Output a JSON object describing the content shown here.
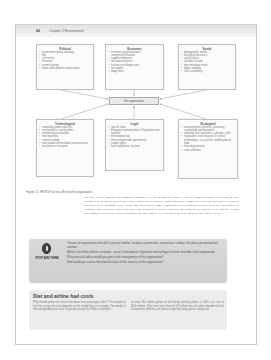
{
  "header": {
    "page_number": "44",
    "chapter_title": "Chapter 2 Environment"
  },
  "diagram": {
    "center": "the organization",
    "boxes": [
      {
        "id": "political",
        "title": "Political",
        "items": [
          "government policy, ideology",
          "war",
          "civil unrest",
          "terrorism",
          "interest groups",
          "trade union policies and activities"
        ]
      },
      {
        "id": "economic",
        "title": "Economic",
        "items": [
          "economic growth patterns",
          "competitor behaviour",
          "supplier behaviour",
          "raw material prices",
          "currency exchange rates",
          "tax regime",
          "wage rates"
        ]
      },
      {
        "id": "social",
        "title": "Social",
        "items": [
          "demographic trends",
          "lifestyle preferences",
          "social values",
          "attitudes to work",
          "discrimination trends",
          "labour mobility",
          "skills availability"
        ]
      },
      {
        "id": "technological",
        "title": "Technological",
        "items": [
          "computing power and cost",
          "new products, new facilities",
          "engineering innovations",
          "new materials",
          "internet trading",
          "new production methods and processes",
          "innovation in transport"
        ]
      },
      {
        "id": "legal",
        "title": "Legal",
        "items": [
          "specific laws",
          "European harmonization of legislation and taxation",
          "international law",
          "international trade agreements",
          "human rights",
          "local regulations, by-laws"
        ]
      },
      {
        "id": "ecological",
        "title": "Ecological",
        "items": [
          "environmental concerns, protecting countryside and biosphere",
          "reducing toxic emissions, pollution, spills",
          "regulations restricting use of certain technologies, e.g. genetic modification of food",
          "hazard prevention",
          "noise pollution"
        ]
      }
    ]
  },
  "figure_caption": "Figure 2.1: PESTLE factors affecting the organization",
  "body_paragraph": "The best way to approach environmental scanning is to do an analysis yourself. This will almost certainly reveal that the neat categories in the model overlap in a rather untidy way in practice. Many legislative changes are politically motivated. Ecological concerns reflect changing social values and preferences. Some technological developments (electric cars) are encouraged by economic and ecological issues (the price and pollution of petrol). However, the point of the analysis is to identify external environmental factors, their interrelationships, and their impact. It is less important to get them into the 'correct' boxes.",
  "stop_and_think": {
    "label": "STOP AND THINK",
    "items": [
      "Choose an organization with which you are familiar: hospital, supermarket, university or college, the place you worked last summer.",
      "Make a list of the political, economic, social, technological, legislative and ecological factors that affect that organization.",
      "What practical advice would you give to the management of this organization?",
      "How would you assess the practical value of this exercise to the organization?"
    ]
  },
  "case": {
    "title": "Diet and airline fuel costs",
    "col_left": "Why should airlines be concerned about their passengers' diets? The amount of fuel that an aircraft uses depends on the weight that it is carrying. The weight of the average American rose 10 pounds during the 1990s, resulting in",
    "col_right": "an extra 350 million gallons of fuel being used by airlines in 2000, at a cost of $140 million. That extra fuel released 3.8 million tons of carbon dioxide into the environment. Airlines can reduce weight by using plastic cutlery and"
  }
}
